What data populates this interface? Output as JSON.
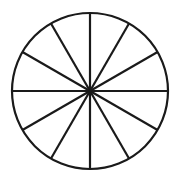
{
  "figure": {
    "background_color": "#ffffff",
    "stroke_color": "#1a1a1a",
    "fill_color": "#111111",
    "glyph_color": "#ffffff",
    "stroke_width": 2.2
  },
  "circle": {
    "center_x": 90,
    "center_y": 91,
    "radius": 78,
    "sector_count": 12,
    "sector_angle_degrees": 30,
    "start_angle_degrees": 0
  },
  "chart_data": {
    "type": "pie",
    "xlabel": "",
    "ylabel": "",
    "categories": [
      "sector-1",
      "sector-2",
      "sector-3",
      "sector-4",
      "sector-5",
      "sector-6",
      "sector-7",
      "sector-8",
      "sector-9",
      "sector-10",
      "sector-11",
      "sector-12"
    ],
    "values": [
      30,
      30,
      30,
      30,
      30,
      30,
      30,
      30,
      30,
      30,
      30,
      30
    ],
    "legend_position": "none",
    "grid": false,
    "highlighted_index": 6,
    "highlighted_label": "Aries",
    "highlighted_symbol": "♈",
    "highlighted_start_degrees": 180,
    "highlighted_end_degrees": 210
  },
  "sectors": [
    {
      "name": "sector-1",
      "start": 0,
      "end": 30,
      "filled": false,
      "symbol": ""
    },
    {
      "name": "sector-2",
      "start": 30,
      "end": 60,
      "filled": false,
      "symbol": ""
    },
    {
      "name": "sector-3",
      "start": 60,
      "end": 90,
      "filled": false,
      "symbol": ""
    },
    {
      "name": "sector-4",
      "start": 90,
      "end": 120,
      "filled": false,
      "symbol": ""
    },
    {
      "name": "sector-5",
      "start": 120,
      "end": 150,
      "filled": false,
      "symbol": ""
    },
    {
      "name": "sector-6",
      "start": 150,
      "end": 180,
      "filled": false,
      "symbol": ""
    },
    {
      "name": "sector-7",
      "start": 180,
      "end": 210,
      "filled": true,
      "symbol": "♈"
    },
    {
      "name": "sector-8",
      "start": 210,
      "end": 240,
      "filled": false,
      "symbol": ""
    },
    {
      "name": "sector-9",
      "start": 240,
      "end": 270,
      "filled": false,
      "symbol": ""
    },
    {
      "name": "sector-10",
      "start": 270,
      "end": 300,
      "filled": false,
      "symbol": ""
    },
    {
      "name": "sector-11",
      "start": 300,
      "end": 330,
      "filled": false,
      "symbol": ""
    },
    {
      "name": "sector-12",
      "start": 330,
      "end": 360,
      "filled": false,
      "symbol": ""
    }
  ],
  "glyph": {
    "symbol": "♈",
    "label": "Aries",
    "x": 38,
    "y": 103
  }
}
